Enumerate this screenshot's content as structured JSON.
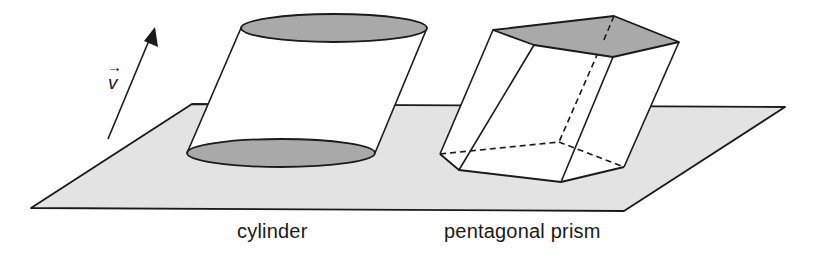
{
  "figure": {
    "vector_label": "v",
    "vector_arrow_glyph": "→",
    "shapes": [
      {
        "id": "cylinder",
        "label": "cylinder"
      },
      {
        "id": "pentagonal-prism",
        "label": "pentagonal prism"
      }
    ]
  },
  "colors": {
    "plane_fill": "#e3e3e3",
    "base_fill": "#a9a9a9",
    "side_fill": "#ffffff",
    "stroke": "#1a1a1a"
  }
}
